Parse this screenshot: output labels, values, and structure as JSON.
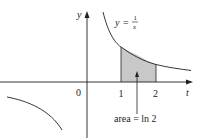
{
  "figure": {
    "function_label_y": "y",
    "function_label_eq": "=",
    "function_num": "1",
    "function_den": "x",
    "y_axis_label": "y",
    "x_axis_label": "t",
    "origin_label": "0",
    "tick_labels": [
      "1",
      "2"
    ],
    "annotation": "area = ln 2",
    "colors": {
      "ink": "#231f20",
      "shade": "#c8c8c8"
    },
    "shaded_interval": [
      1,
      2
    ]
  }
}
